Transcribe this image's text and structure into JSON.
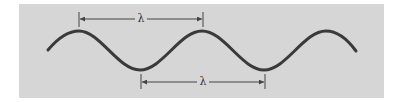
{
  "diagram": {
    "colors": {
      "background": "#ffffff",
      "panel": "#d6d6d6",
      "wave": "#3a3a3a",
      "dimension_line": "#444444"
    },
    "wave": {
      "start": [
        48,
        50
      ],
      "crests": [
        [
          79,
          31
        ],
        [
          202,
          31
        ],
        [
          326,
          31
        ]
      ],
      "troughs": [
        [
          140,
          70
        ],
        [
          264,
          70
        ]
      ],
      "end": [
        356,
        51
      ]
    },
    "dimensions": [
      {
        "id": "crest-to-crest",
        "label": "λ",
        "x1": 79,
        "x2": 203,
        "y": 19,
        "label_x": 141
      },
      {
        "id": "trough-to-trough",
        "label": "λ",
        "x1": 141,
        "x2": 265,
        "y": 82,
        "label_x": 203
      }
    ]
  }
}
